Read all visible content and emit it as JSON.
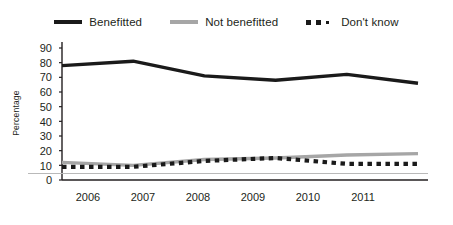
{
  "chart_data": {
    "type": "line",
    "title": "",
    "subtitle": "",
    "xlabel": "",
    "ylabel": "Percentage",
    "categories": [
      "2006",
      "2007",
      "2008",
      "2009",
      "2010",
      "2011"
    ],
    "x": [
      2006,
      2007,
      2008,
      2009,
      2010,
      2011
    ],
    "ylim": [
      0,
      90
    ],
    "yticks": [
      0,
      10,
      20,
      30,
      40,
      50,
      60,
      70,
      80,
      90
    ],
    "ytick_labels": [
      "0",
      "10",
      "20",
      "30",
      "40",
      "50",
      "60",
      "70",
      "80",
      "90"
    ],
    "grid": false,
    "legend_position": "top",
    "series": [
      {
        "name": "Benefitted",
        "color": "#1a1a1a",
        "style": "solid",
        "values": [
          78,
          81,
          71,
          68,
          72,
          66
        ]
      },
      {
        "name": "Not benefitted",
        "color": "#a6a6a6",
        "style": "solid",
        "values": [
          12,
          10,
          14,
          15,
          17,
          18
        ]
      },
      {
        "name": "Don't know",
        "color": "#1a1a1a",
        "style": "dashed",
        "values": [
          9,
          9,
          13,
          15,
          11,
          11
        ]
      }
    ]
  },
  "legend": {
    "items": [
      {
        "label": "Benefitted",
        "swatch": "solid-black-line-swatch"
      },
      {
        "label": "Not benefitted",
        "swatch": "solid-gray-line-swatch"
      },
      {
        "label": "Don't know",
        "swatch": "dashed-black-line-swatch"
      }
    ]
  },
  "axis": {
    "y_label": "Percentage",
    "y_ticks": [
      "90",
      "80",
      "70",
      "60",
      "50",
      "40",
      "30",
      "20",
      "10",
      "0"
    ],
    "x_ticks": [
      "2006",
      "2007",
      "2008",
      "2009",
      "2010",
      "2011"
    ]
  },
  "colors": {
    "benefitted": "#1a1a1a",
    "not_benefitted": "#a6a6a6",
    "dont_know": "#1a1a1a",
    "axis": "#231f20",
    "rule": "#b9b9b9",
    "background": "#ffffff"
  }
}
